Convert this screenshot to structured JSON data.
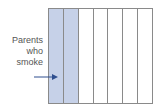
{
  "diagram": {
    "label_lines": [
      "Parents",
      "who",
      "smoke"
    ],
    "strip_count": 7,
    "shaded_strips": 2,
    "colors": {
      "shaded": "#c6d1e8",
      "border": "#8a8a8a",
      "arrow": "#2f4f8f",
      "text": "#555555"
    },
    "arrow_icon": "arrow-right"
  }
}
